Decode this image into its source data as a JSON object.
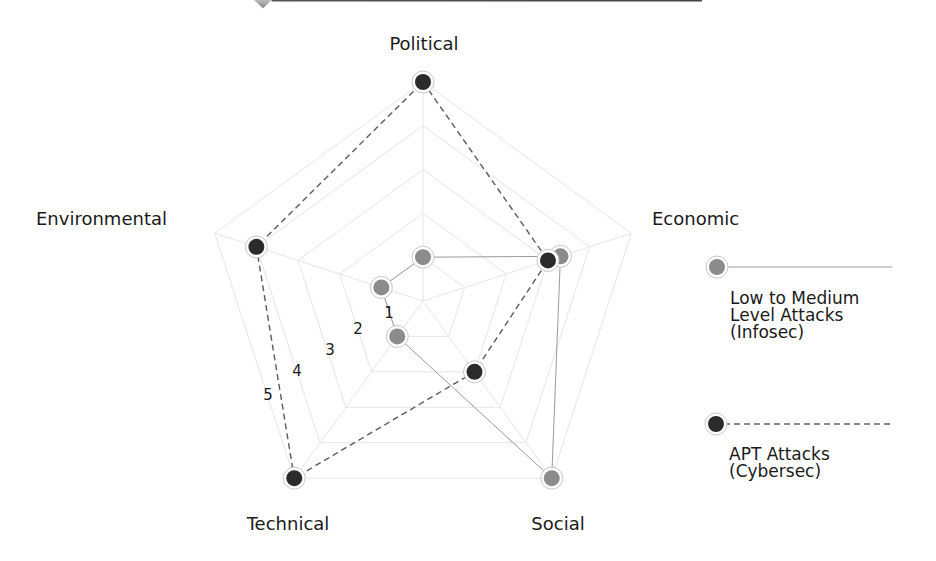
{
  "chart_data": {
    "type": "radar",
    "title": "",
    "axes": [
      "Political",
      "Economic",
      "Social",
      "Technical",
      "Environmental"
    ],
    "scale": {
      "min": 0,
      "max": 5,
      "tick_labels": [
        "1",
        "2",
        "3",
        "4",
        "5"
      ]
    },
    "series": [
      {
        "name": "Low to Medium Level Attacks (Infosec)",
        "color": "#8c8c8c",
        "line_style": "solid",
        "values": [
          1,
          3.3,
          5,
          1,
          1
        ]
      },
      {
        "name": "APT Attacks (Cybersec)",
        "color": "#2b2b2b",
        "line_style": "dashed",
        "values": [
          5,
          3,
          2,
          5,
          4
        ]
      }
    ],
    "legend_position": "right",
    "grid": true
  },
  "axis_labels": {
    "political": "Political",
    "economic": "Economic",
    "social": "Social",
    "technical": "Technical",
    "environmental": "Environmental"
  },
  "scale_labels": [
    "1",
    "2",
    "3",
    "4",
    "5"
  ],
  "legend": {
    "infosec": {
      "line1": "Low to Medium",
      "line2": "Level Attacks",
      "line3": "(Infosec)"
    },
    "cybersec": {
      "line1": "APT Attacks",
      "line2": "(Cybersec)"
    }
  },
  "colors": {
    "infosec_dot": "#8c8c8c",
    "cybersec_dot": "#2b2b2b",
    "grid": "#e6e6e6",
    "header_bar": "#3a3a3a"
  }
}
